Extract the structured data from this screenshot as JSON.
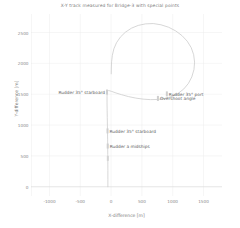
{
  "chart_data": {
    "type": "line",
    "title": "X-Y track measured for Bridge-3 with special points",
    "xlabel": "X-difference [m]",
    "ylabel": "Y-difference [m]",
    "xlim": [
      -1300,
      1800
    ],
    "ylim": [
      -150,
      2800
    ],
    "xticks": [
      -1000,
      -500,
      0,
      500,
      1000,
      1500
    ],
    "xticklabels": [
      "-1000",
      "-500",
      "0",
      "500",
      "1000",
      "1500"
    ],
    "yticks": [
      0,
      500,
      1000,
      1500,
      2000,
      2500
    ],
    "yticklabels": [
      "0",
      "500",
      "1000",
      "1500",
      "2000",
      "2500"
    ],
    "grid": true,
    "legend": null,
    "series": [
      {
        "name": "X-Y track",
        "color": "#c9c9c9",
        "points": [
          [
            -52,
            0
          ],
          [
            -52,
            120
          ],
          [
            -52,
            260
          ],
          [
            -53,
            400
          ],
          [
            -54,
            520
          ],
          [
            -55,
            640
          ],
          [
            -56,
            760
          ],
          [
            -58,
            880
          ],
          [
            -60,
            1000
          ],
          [
            -62,
            1120
          ],
          [
            -64,
            1240
          ],
          [
            -66,
            1360
          ],
          [
            -66,
            1460
          ],
          [
            -62,
            1540
          ],
          [
            -40,
            1560
          ],
          [
            10,
            1545
          ],
          [
            80,
            1520
          ],
          [
            170,
            1492
          ],
          [
            280,
            1462
          ],
          [
            400,
            1437
          ],
          [
            520,
            1420
          ],
          [
            640,
            1412
          ],
          [
            760,
            1415
          ],
          [
            880,
            1432
          ],
          [
            990,
            1465
          ],
          [
            1090,
            1515
          ],
          [
            1180,
            1585
          ],
          [
            1255,
            1675
          ],
          [
            1310,
            1780
          ],
          [
            1345,
            1900
          ],
          [
            1355,
            2020
          ],
          [
            1340,
            2140
          ],
          [
            1300,
            2255
          ],
          [
            1235,
            2360
          ],
          [
            1150,
            2450
          ],
          [
            1050,
            2525
          ],
          [
            935,
            2585
          ],
          [
            810,
            2625
          ],
          [
            685,
            2645
          ],
          [
            560,
            2640
          ],
          [
            440,
            2615
          ],
          [
            330,
            2570
          ],
          [
            232,
            2505
          ],
          [
            150,
            2425
          ],
          [
            88,
            2335
          ],
          [
            45,
            2235
          ],
          [
            20,
            2130
          ],
          [
            8,
            2025
          ],
          [
            4,
            1925
          ],
          [
            2,
            1830
          ]
        ]
      }
    ],
    "annotations": [
      {
        "label": "Rudder 35° starboard",
        "x": -66,
        "y": 1535,
        "align": "right"
      },
      {
        "label": "Rudder 35° port",
        "x": 905,
        "y": 1505,
        "align": "left"
      },
      {
        "label": "Overshoot angle",
        "x": 760,
        "y": 1432,
        "align": "left"
      },
      {
        "label": "Rudder 35° starboard",
        "x": -58,
        "y": 905,
        "align": "left"
      },
      {
        "label": "Rudder a midships",
        "x": -55,
        "y": 660,
        "align": "left"
      }
    ],
    "markers": [
      {
        "x": -66,
        "y": 1535,
        "color": "#cfcfcf"
      },
      {
        "x": 905,
        "y": 1505,
        "color": "#cfcfcf"
      },
      {
        "x": 760,
        "y": 1432,
        "color": "#cfcfcf"
      },
      {
        "x": -58,
        "y": 905,
        "color": "#cfcfcf"
      },
      {
        "x": -55,
        "y": 660,
        "color": "#cfcfcf"
      },
      {
        "x": -53,
        "y": 460,
        "color": "#d4d4d4"
      }
    ],
    "colors": {
      "track": "#c9c9c9",
      "grid": "#ededed",
      "axis": "#d8d8d8",
      "text": "#7d7d7d",
      "annotation": "#5f5f5f",
      "background": "#ffffff"
    }
  }
}
